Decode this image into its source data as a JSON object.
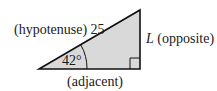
{
  "diagram": {
    "type": "right-triangle",
    "colors": {
      "fill": "#d9d9d9",
      "stroke": "#111111",
      "text": "#1a1a1a",
      "background": "#ffffff"
    },
    "labels": {
      "hypotenuse": "(hypotenuse) 25",
      "opposite_var": "L",
      "opposite": " (opposite)",
      "adjacent": "(adjacent)",
      "angle": "42°"
    },
    "values": {
      "hypotenuse_length": 25,
      "angle_degrees": 42
    }
  }
}
